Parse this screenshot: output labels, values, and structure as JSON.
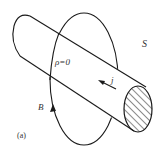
{
  "figure": {
    "panel_label": "(a)",
    "surface_label": "S",
    "charge_density_label": "ρ=0",
    "current_density_label": "j",
    "magnetic_field_label": "B"
  },
  "colors": {
    "stroke": "#1a1a1a",
    "text": "#333333",
    "background": "#ffffff"
  }
}
